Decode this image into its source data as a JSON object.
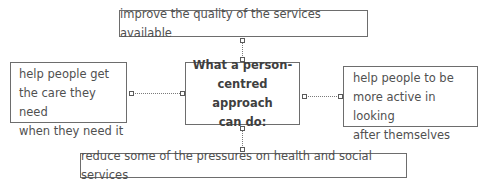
{
  "diagram": {
    "center": {
      "lines": [
        "What a person-",
        "centred approach",
        "can do:"
      ]
    },
    "top": {
      "text": "improve the quality of the services available"
    },
    "left": {
      "lines": [
        "help people get",
        "the care they need",
        "when they need it"
      ]
    },
    "right": {
      "lines": [
        "help people to be",
        "more active in looking",
        "after themselves"
      ]
    },
    "bottom": {
      "text": "reduce some of the pressures on health and social services"
    },
    "colors": {
      "border": "#6d6d6d",
      "text": "#505050",
      "background": "#ffffff"
    }
  }
}
